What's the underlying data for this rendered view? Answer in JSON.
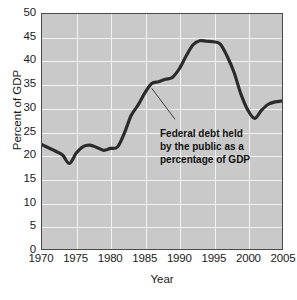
{
  "chart_data": {
    "type": "line",
    "title": "",
    "subtitle": "",
    "xlabel": "Year",
    "ylabel": "Percent of GDP",
    "xlim": [
      1970,
      2005
    ],
    "ylim": [
      0,
      50
    ],
    "grid": true,
    "legend_position": "none",
    "x_ticks": [
      1970,
      1975,
      1980,
      1985,
      1990,
      1995,
      2000,
      2005
    ],
    "y_ticks": [
      0,
      5,
      10,
      15,
      20,
      25,
      30,
      35,
      40,
      45,
      50
    ],
    "series": [
      {
        "name": "Federal debt held by the public as a percentage of GDP",
        "color": "#2b2b2b",
        "x": [
          1970,
          1971,
          1972,
          1973,
          1974,
          1975,
          1976,
          1977,
          1978,
          1979,
          1980,
          1981,
          1982,
          1983,
          1984,
          1985,
          1986,
          1987,
          1988,
          1989,
          1990,
          1991,
          1992,
          1993,
          1994,
          1995,
          1996,
          1997,
          1998,
          1999,
          2000,
          2001,
          2002,
          2003,
          2004,
          2005
        ],
        "values": [
          22.2,
          21.5,
          20.8,
          20.0,
          18.2,
          20.4,
          21.8,
          22.1,
          21.6,
          21.0,
          21.4,
          21.7,
          24.6,
          28.4,
          30.6,
          33.2,
          35.2,
          35.6,
          36.1,
          36.5,
          38.3,
          41.0,
          43.4,
          44.3,
          44.2,
          44.1,
          43.6,
          41.0,
          37.6,
          33.0,
          29.6,
          27.8,
          29.5,
          30.8,
          31.3,
          31.5
        ]
      }
    ],
    "annotations": [
      {
        "text_lines": [
          "Federal debt held",
          "by the public as a",
          "percentage of GDP"
        ],
        "leader_from": [
          1986.0,
          34.2
        ],
        "leader_to": [
          1989.4,
          27.6
        ]
      }
    ],
    "colors": {
      "plot_background": "#c9c9c9",
      "gridline": "#f2f2f2",
      "frame": "#4a4a4a",
      "line": "#2b2b2b",
      "text": "#1a1a1a",
      "page_background": "#ffffff"
    }
  }
}
